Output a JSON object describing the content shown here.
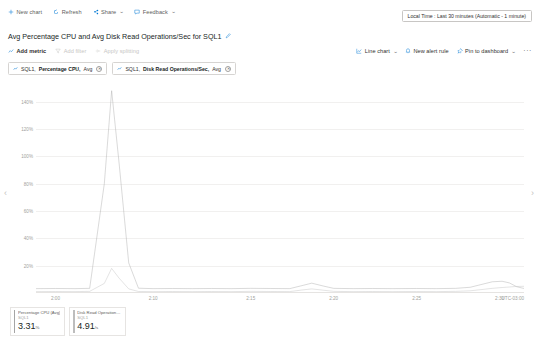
{
  "toolbar_top": {
    "items": [
      {
        "label": "New chart",
        "icon": "plus-icon",
        "has_chevron": false
      },
      {
        "label": "Refresh",
        "icon": "refresh-icon",
        "has_chevron": false
      },
      {
        "label": "Share",
        "icon": "share-icon",
        "has_chevron": true
      },
      {
        "label": "Feedback",
        "icon": "feedback-icon",
        "has_chevron": true
      }
    ]
  },
  "time_picker": {
    "label": "Local Time : Last 30 minutes (Automatic - 1 minute)"
  },
  "header": {
    "title": "Avg Percentage CPU and Avg Disk Read Operations/Sec for SQL1",
    "edit_icon": "pencil-icon"
  },
  "toolbar_sub": {
    "left": [
      {
        "label": "Add metric",
        "icon": "add-metric-icon",
        "state": "active"
      },
      {
        "label": "Add filter",
        "icon": "filter-icon",
        "state": "disabled"
      },
      {
        "label": "Apply splitting",
        "icon": "splitting-icon",
        "state": "disabled"
      }
    ],
    "right": [
      {
        "label": "Line chart",
        "icon": "line-chart-icon",
        "has_chevron": true
      },
      {
        "label": "New alert rule",
        "icon": "alert-icon",
        "has_chevron": false
      },
      {
        "label": "Pin to dashboard",
        "icon": "pin-icon",
        "has_chevron": true
      }
    ],
    "overflow_label": "···"
  },
  "metric_pills": [
    {
      "scope": "SQL1,",
      "metric": "Percentage CPU,",
      "agg": "Avg",
      "close": "✕",
      "icon": "metric-icon"
    },
    {
      "scope": "SQL1,",
      "metric": "Disk Read Operations/Sec,",
      "agg": "Avg",
      "close": "✕",
      "icon": "metric-icon"
    }
  ],
  "nav": {
    "left_icon": "chevron-left-icon",
    "right_icon": "chevron-right-icon",
    "left_glyph": "‹",
    "right_glyph": "›"
  },
  "legend": [
    {
      "metric": "Percentage CPU (Avg)",
      "resource": "SQL1",
      "value": "3.31",
      "unit": "%",
      "color": "#a5a5a5"
    },
    {
      "metric": "Disk Read Operations...",
      "resource": "SQL1",
      "value": "4.91",
      "unit": "/s",
      "color": "#bdbdbd"
    }
  ],
  "chart_data": {
    "type": "line",
    "title": "Avg Percentage CPU and Avg Disk Read Operations/Sec for SQL1",
    "xlabel": "",
    "ylabel": "",
    "grid": true,
    "legend_position": "bottom-left",
    "timezone": "UTC-03:00",
    "ylim": [
      0,
      150
    ],
    "yticks": [
      20,
      40,
      60,
      80,
      100,
      120,
      140
    ],
    "ytick_labels": [
      "20%",
      "40%",
      "60%",
      "80%",
      "100%",
      "120%",
      "140%"
    ],
    "xtick_labels": [
      "2:00",
      "2:10",
      "2:15",
      "2:20",
      "2:25",
      "2:30"
    ],
    "xtick_positions": [
      0.04,
      0.24,
      0.44,
      0.61,
      0.78,
      0.95
    ],
    "x": [
      0.0,
      0.04,
      0.08,
      0.11,
      0.14,
      0.155,
      0.17,
      0.19,
      0.21,
      0.24,
      0.28,
      0.32,
      0.36,
      0.4,
      0.44,
      0.48,
      0.52,
      0.545,
      0.565,
      0.59,
      0.61,
      0.65,
      0.69,
      0.73,
      0.78,
      0.82,
      0.86,
      0.89,
      0.91,
      0.935,
      0.955,
      0.97,
      0.985,
      1.0
    ],
    "series": [
      {
        "name": "Percentage CPU (Avg)",
        "color": "#a5a5a5",
        "unit": "%",
        "last_value": 3.31,
        "values": [
          3.2,
          3.3,
          3.2,
          3.4,
          80.0,
          148.0,
          96.0,
          22.0,
          3.5,
          3.2,
          3.3,
          3.2,
          3.3,
          3.2,
          3.4,
          3.3,
          3.2,
          5.4,
          7.2,
          5.0,
          3.4,
          3.2,
          3.3,
          3.2,
          3.3,
          3.2,
          3.4,
          4.2,
          6.0,
          8.2,
          8.6,
          7.4,
          4.6,
          3.31
        ]
      },
      {
        "name": "Disk Read Operations/Sec (Avg)",
        "color": "#bdbdbd",
        "unit": "/s",
        "last_value": 4.91,
        "values": [
          1.0,
          1.1,
          1.0,
          1.2,
          7.0,
          18.0,
          11.0,
          3.0,
          1.1,
          1.0,
          1.1,
          1.0,
          1.1,
          1.0,
          1.2,
          1.1,
          1.0,
          2.2,
          3.0,
          2.0,
          1.2,
          1.0,
          1.1,
          1.0,
          1.1,
          1.0,
          1.2,
          1.6,
          2.4,
          3.4,
          4.0,
          4.4,
          4.8,
          4.91
        ]
      }
    ]
  }
}
